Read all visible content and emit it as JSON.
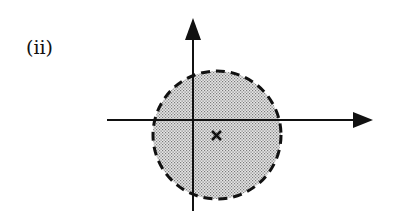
{
  "figure": {
    "panel_label": "(ii)",
    "axes": {
      "x_axis": "horizontal arrow",
      "y_axis": "vertical arrow"
    },
    "region": {
      "shape": "circle",
      "border": "dashed",
      "fill": "dotted gray",
      "fill_color": "#c8c8c8"
    },
    "marker": {
      "symbol": "×",
      "description": "center point offset right and below origin"
    }
  }
}
